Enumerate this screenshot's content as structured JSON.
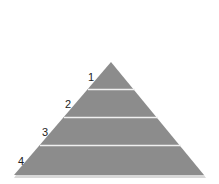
{
  "diagram": {
    "type": "pyramid",
    "fill_color": "#8c8c8c",
    "separator_color": "#f0f0f0",
    "shadow_color": "#d8d8d8",
    "levels": [
      {
        "label": "1"
      },
      {
        "label": "2"
      },
      {
        "label": "3"
      },
      {
        "label": "4"
      }
    ]
  }
}
